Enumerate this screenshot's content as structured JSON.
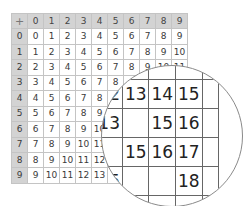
{
  "table": {
    "corner": "+",
    "col_headers": [
      "0",
      "1",
      "2",
      "3",
      "4",
      "5",
      "6",
      "7",
      "8",
      "9"
    ],
    "rows": [
      {
        "header": "0",
        "cells": [
          "0",
          "1",
          "2",
          "3",
          "4",
          "5",
          "6",
          "7",
          "8",
          "9"
        ]
      },
      {
        "header": "1",
        "cells": [
          "1",
          "2",
          "3",
          "4",
          "5",
          "6",
          "7",
          "8",
          "9",
          "10"
        ]
      },
      {
        "header": "2",
        "cells": [
          "2",
          "3",
          "4",
          "5",
          "6",
          "7",
          "8",
          "9",
          "10",
          "11"
        ]
      },
      {
        "header": "3",
        "cells": [
          "3",
          "4",
          "5",
          "6",
          "7",
          "8",
          "",
          "",
          "",
          ""
        ]
      },
      {
        "header": "4",
        "cells": [
          "4",
          "5",
          "6",
          "7",
          "8",
          "",
          "",
          "",
          "",
          ""
        ]
      },
      {
        "header": "5",
        "cells": [
          "5",
          "6",
          "7",
          "8",
          "9",
          "",
          "",
          "",
          "",
          ""
        ]
      },
      {
        "header": "6",
        "cells": [
          "6",
          "7",
          "8",
          "9",
          "10",
          "",
          "",
          "",
          "",
          ""
        ]
      },
      {
        "header": "7",
        "cells": [
          "7",
          "8",
          "9",
          "10",
          "11",
          "",
          "",
          "",
          "",
          ""
        ]
      },
      {
        "header": "8",
        "cells": [
          "8",
          "9",
          "10",
          "11",
          "12",
          "",
          "",
          "",
          "",
          ""
        ]
      },
      {
        "header": "9",
        "cells": [
          "9",
          "10",
          "11",
          "12",
          "13",
          "",
          "",
          "",
          "",
          ""
        ]
      }
    ]
  },
  "magnifier": {
    "rows": [
      [
        "",
        "",
        "",
        "",
        "",
        ""
      ],
      [
        "",
        "12",
        "13",
        "14",
        "15",
        ""
      ],
      [
        "",
        "13",
        "",
        "15",
        "16",
        ""
      ],
      [
        "",
        "",
        "15",
        "16",
        "17",
        ""
      ],
      [
        "",
        "15",
        "",
        "",
        "18",
        ""
      ],
      [
        "",
        "",
        "",
        "",
        "",
        ""
      ]
    ]
  },
  "colors": {
    "header_bg": "#d3d3d3",
    "grid_line": "#c4c4c4",
    "text": "#3a3a3a",
    "magnifier_border": "#8a8a8a"
  }
}
